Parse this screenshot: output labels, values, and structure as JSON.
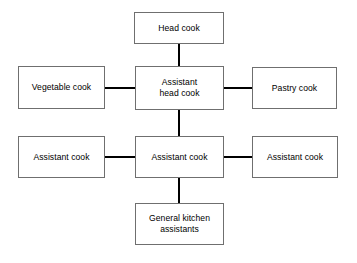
{
  "diagram": {
    "background_color": "#ffffff",
    "box_border_color": "#6f6f6f",
    "box_fill_color": "#ffffff",
    "connector_color": "#000000",
    "text_color": "#000000",
    "nodes": {
      "head_cook": {
        "label": "Head cook",
        "x": 134,
        "y": 12,
        "width": 90,
        "height": 32,
        "lines": 1
      },
      "vegetable_cook": {
        "label": "Vegetable cook",
        "x": 18,
        "y": 66,
        "width": 87,
        "height": 43,
        "lines": 1
      },
      "assistant_head_cook": {
        "label": "Assistant\nhead cook",
        "x": 135,
        "y": 66,
        "width": 89,
        "height": 44,
        "lines": 2
      },
      "pastry_cook": {
        "label": "Pastry cook",
        "x": 252,
        "y": 67,
        "width": 85,
        "height": 42,
        "lines": 1
      },
      "assistant_cook_left": {
        "label": "Assistant cook",
        "x": 18,
        "y": 136,
        "width": 87,
        "height": 42,
        "lines": 1
      },
      "assistant_cook_center": {
        "label": "Assistant cook",
        "x": 135,
        "y": 136,
        "width": 89,
        "height": 42,
        "lines": 1
      },
      "assistant_cook_right": {
        "label": "Assistant cook",
        "x": 252,
        "y": 136,
        "width": 86,
        "height": 42,
        "lines": 1
      },
      "general_kitchen_assistants": {
        "label": "General kitchen\nassistants",
        "x": 135,
        "y": 203,
        "width": 89,
        "height": 42,
        "lines": 2
      }
    },
    "connectors": {
      "head_to_assistant_head": {
        "from": "head_cook",
        "to": "assistant_head_cook",
        "orientation": "vertical",
        "x": 178,
        "y": 43,
        "length": 24
      },
      "vegetable_to_assistant_head": {
        "from": "vegetable_cook",
        "to": "assistant_head_cook",
        "orientation": "horizontal",
        "x": 104,
        "y": 87,
        "length": 32
      },
      "assistant_head_to_pastry": {
        "from": "assistant_head_cook",
        "to": "pastry_cook",
        "orientation": "horizontal",
        "x": 223,
        "y": 87,
        "length": 30
      },
      "assistant_head_to_assistant_cook": {
        "from": "assistant_head_cook",
        "to": "assistant_cook_center",
        "orientation": "vertical",
        "x": 178,
        "y": 109,
        "length": 28
      },
      "left_assistant_to_center": {
        "from": "assistant_cook_left",
        "to": "assistant_cook_center",
        "orientation": "horizontal",
        "x": 104,
        "y": 156,
        "length": 32
      },
      "center_to_right_assistant": {
        "from": "assistant_cook_center",
        "to": "assistant_cook_right",
        "orientation": "horizontal",
        "x": 223,
        "y": 156,
        "length": 30
      },
      "assistant_cook_to_general": {
        "from": "assistant_cook_center",
        "to": "general_kitchen_assistants",
        "orientation": "vertical",
        "x": 178,
        "y": 177,
        "length": 27
      }
    }
  }
}
